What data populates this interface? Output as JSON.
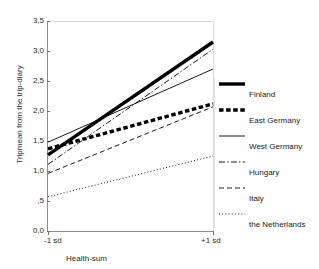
{
  "figure": {
    "title_remnant": "",
    "background": "#ffffff"
  },
  "axes": {
    "ylabel": "Tripmean from the trip-diary",
    "xlabel": "Health-sum",
    "yticks": [
      "3,5",
      "3,0",
      "2,5",
      "2,0",
      "1,5",
      "1,0",
      ",5",
      "0,0"
    ],
    "xticks": [
      "-1 sd",
      "+1 sd"
    ]
  },
  "legend": {
    "items": [
      {
        "label": "Finland",
        "style": "thick-solid",
        "color": "#000000"
      },
      {
        "label": "East Germany",
        "style": "thick-dashed",
        "color": "#000000"
      },
      {
        "label": "West Germany",
        "style": "thin-solid",
        "color": "#000000"
      },
      {
        "label": "Hungary",
        "style": "dash-dot",
        "color": "#000000"
      },
      {
        "label": "Italy",
        "style": "dashed",
        "color": "#000000"
      },
      {
        "label": "the Netherlands",
        "style": "dotted",
        "color": "#000000"
      }
    ]
  },
  "chart_data": {
    "type": "line",
    "title": "",
    "xlabel": "Health-sum",
    "ylabel": "Tripmean from the trip-diary",
    "x": [
      "-1 sd",
      "+1 sd"
    ],
    "ylim": [
      0.0,
      3.5
    ],
    "yticks": [
      0.0,
      0.5,
      1.0,
      1.5,
      2.0,
      2.5,
      3.0,
      3.5
    ],
    "grid": false,
    "legend_position": "right",
    "series": [
      {
        "name": "Finland",
        "style": "thick-solid",
        "values": [
          1.27,
          3.15
        ]
      },
      {
        "name": "East Germany",
        "style": "thick-dashed",
        "values": [
          1.37,
          2.12
        ]
      },
      {
        "name": "West Germany",
        "style": "thin-solid",
        "values": [
          1.48,
          2.7
        ]
      },
      {
        "name": "Hungary",
        "style": "dash-dot",
        "values": [
          1.11,
          3.03
        ]
      },
      {
        "name": "Italy",
        "style": "dashed",
        "values": [
          0.96,
          2.07
        ]
      },
      {
        "name": "the Netherlands",
        "style": "dotted",
        "values": [
          0.57,
          1.25
        ]
      }
    ]
  }
}
